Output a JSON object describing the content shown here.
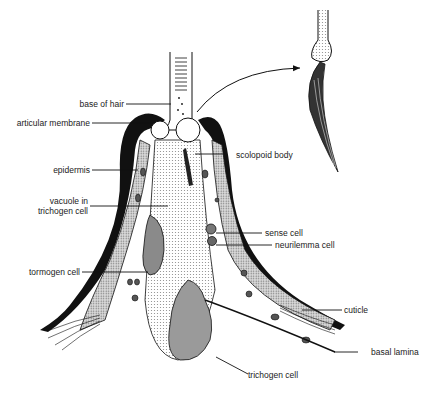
{
  "diagram": {
    "labels": {
      "base_of_hair": "base of hair",
      "articular_membrane": "articular membrane",
      "epidermis": "epidermis",
      "vacuole_line1": "vacuole in",
      "vacuole_line2": "trichogen cell",
      "tormogen_cell": "tormogen cell",
      "scolopoid_body": "scolopoid body",
      "sense_cell": "sense cell",
      "neurilemma_cell": "neurilemma cell",
      "cuticle": "cuticle",
      "basal_lamina": "basal lamina",
      "trichogen_cell": "trichogen cell"
    },
    "colors": {
      "ink": "#111111",
      "stipple": "#bdbdbd",
      "cell_dark": "#8a8a8a",
      "background": "#ffffff"
    }
  }
}
